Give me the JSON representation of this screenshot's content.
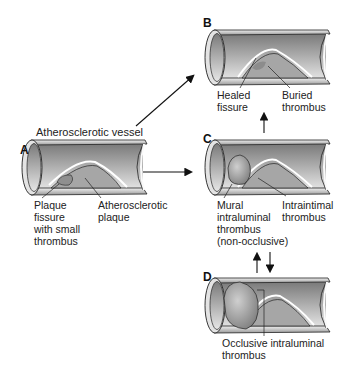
{
  "figure": {
    "panels": [
      {
        "id": "A",
        "letter": "A",
        "title": "Atherosclerotic vessel",
        "labels": [
          "Plaque\nfissure\nwith small\nthrombus",
          "Atherosclerotic\nplaque"
        ]
      },
      {
        "id": "B",
        "letter": "B",
        "labels": [
          "Healed\nfissure",
          "Buried\nthrombus"
        ]
      },
      {
        "id": "C",
        "letter": "C",
        "labels": [
          "Mural\nintraluminal\nthrombus\n(non-occlusive)",
          "Intraintimal\nthrombus"
        ]
      },
      {
        "id": "D",
        "letter": "D",
        "labels": [
          "Occlusive intraluminal\nthrombus"
        ]
      }
    ],
    "arrows": [
      {
        "from": "A",
        "to": "B"
      },
      {
        "from": "A",
        "to": "C"
      },
      {
        "from": "C",
        "to": "B"
      },
      {
        "from": "C",
        "to": "D"
      },
      {
        "from": "D",
        "to": "C"
      }
    ],
    "colors": {
      "vessel_dark": "#6e6e6e",
      "vessel_light": "#d8d8d8",
      "plaque": "#a9a9a9",
      "thrombus": "#8c8c8c",
      "outline": "#222222"
    }
  }
}
